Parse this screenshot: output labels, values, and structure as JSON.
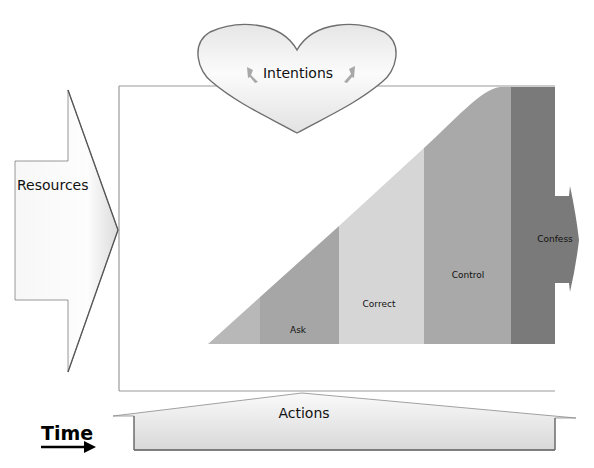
{
  "diagram": {
    "title_fragment": "",
    "intentions": {
      "label": "Intentions",
      "icon_left": "lightning-bolt-icon",
      "icon_right": "lightning-bolt-icon"
    },
    "resources": {
      "label": "Resources"
    },
    "actions": {
      "label": "Actions"
    },
    "time": {
      "label": "Time",
      "icon": "right-arrow-icon"
    },
    "stages": [
      {
        "label": "Ask",
        "color": "#a6a6a6"
      },
      {
        "label": "Correct",
        "color": "#d6d6d6"
      },
      {
        "label": "Control",
        "color": "#a9a9a9"
      },
      {
        "label": "Confess",
        "color": "#7a7a7a"
      }
    ],
    "colors": {
      "ramp_tip": "#b8b8b8",
      "frame": "#9a9a9a",
      "shape_fill_light": "#f4f4f4",
      "shape_fill_dark": "#d4d4d4",
      "shape_stroke": "#7f7f7f"
    }
  }
}
